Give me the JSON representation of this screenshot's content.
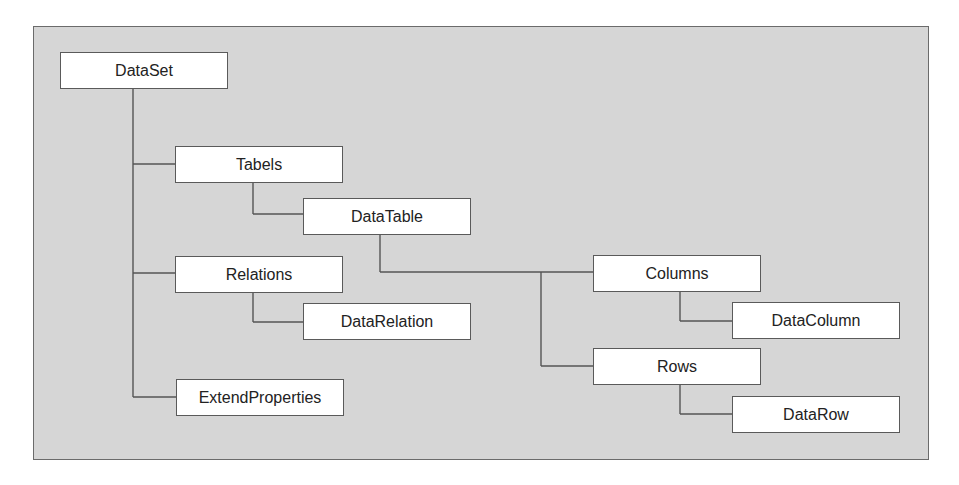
{
  "diagram": {
    "colors": {
      "panel": "#d6d6d6",
      "node": "#ffffff",
      "line": "#555555",
      "text": "#222222"
    },
    "nodes": [
      {
        "id": "dataset",
        "label": "DataSet",
        "parent": null
      },
      {
        "id": "tables",
        "label": "Tabels",
        "parent": "dataset"
      },
      {
        "id": "datatable",
        "label": "DataTable",
        "parent": "tables"
      },
      {
        "id": "columns",
        "label": "Columns",
        "parent": "datatable"
      },
      {
        "id": "datacolumn",
        "label": "DataColumn",
        "parent": "columns"
      },
      {
        "id": "rows",
        "label": "Rows",
        "parent": "datatable"
      },
      {
        "id": "datarow",
        "label": "DataRow",
        "parent": "rows"
      },
      {
        "id": "relations",
        "label": "Relations",
        "parent": "dataset"
      },
      {
        "id": "datarelation",
        "label": "DataRelation",
        "parent": "relations"
      },
      {
        "id": "extendproperties",
        "label": "ExtendProperties",
        "parent": "dataset"
      }
    ]
  }
}
